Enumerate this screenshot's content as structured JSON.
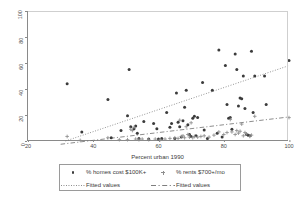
{
  "chart_data": {
    "type": "scatter",
    "title": "",
    "xlabel": "Percent urban 1990",
    "ylabel": "",
    "xlim": [
      20,
      100
    ],
    "ylim": [
      0,
      100
    ],
    "xticks": [
      20,
      40,
      60,
      80,
      100
    ],
    "yticks": [
      0,
      20,
      40,
      60,
      80,
      100
    ],
    "grid": false,
    "legend_position": "below-axis",
    "series": [
      {
        "name": "% homes cost $100K+",
        "marker": "filled-circle",
        "color": "#3b3b3b",
        "points": [
          [
            32.0,
            44.0
          ],
          [
            36.5,
            7.0
          ],
          [
            44.5,
            32.0
          ],
          [
            45.5,
            2.5
          ],
          [
            48.5,
            8.0
          ],
          [
            50.5,
            19.5
          ],
          [
            51.0,
            55.0
          ],
          [
            51.5,
            11.0
          ],
          [
            52.5,
            9.5
          ],
          [
            53.0,
            11.5
          ],
          [
            53.5,
            6.0
          ],
          [
            54.0,
            2.0
          ],
          [
            55.5,
            15.0
          ],
          [
            57.0,
            1.5
          ],
          [
            58.5,
            13.5
          ],
          [
            59.5,
            9.5
          ],
          [
            60.0,
            1.5
          ],
          [
            61.0,
            2.0
          ],
          [
            62.5,
            22.0
          ],
          [
            63.5,
            10.5
          ],
          [
            64.0,
            13.5
          ],
          [
            65.0,
            2.0
          ],
          [
            65.5,
            37.0
          ],
          [
            66.0,
            14.5
          ],
          [
            66.5,
            11.0
          ],
          [
            67.0,
            3.0
          ],
          [
            67.5,
            15.5
          ],
          [
            68.0,
            26.0
          ],
          [
            68.5,
            39.0
          ],
          [
            69.0,
            12.5
          ],
          [
            69.5,
            5.0
          ],
          [
            70.0,
            3.5
          ],
          [
            70.5,
            17.5
          ],
          [
            71.0,
            19.0
          ],
          [
            71.5,
            4.0
          ],
          [
            72.0,
            18.0
          ],
          [
            73.5,
            45.0
          ],
          [
            74.0,
            8.5
          ],
          [
            75.0,
            2.0
          ],
          [
            76.5,
            39.0
          ],
          [
            78.0,
            6.0
          ],
          [
            78.5,
            70.0
          ],
          [
            79.5,
            3.0
          ],
          [
            80.5,
            58.0
          ],
          [
            81.0,
            28.0
          ],
          [
            81.5,
            17.5
          ],
          [
            82.0,
            18.0
          ],
          [
            82.5,
            9.0
          ],
          [
            83.5,
            67.0
          ],
          [
            84.0,
            55.0
          ],
          [
            84.5,
            27.0
          ],
          [
            85.0,
            33.0
          ],
          [
            85.5,
            32.5
          ],
          [
            86.0,
            50.0
          ],
          [
            86.5,
            25.0
          ],
          [
            87.0,
            5.0
          ],
          [
            87.5,
            4.5
          ],
          [
            88.0,
            4.0
          ],
          [
            88.5,
            69.0
          ],
          [
            89.0,
            22.0
          ],
          [
            89.5,
            50.0
          ],
          [
            92.5,
            50.0
          ],
          [
            93.0,
            28.0
          ],
          [
            100.0,
            62.0
          ]
        ]
      },
      {
        "name": "% rents $700+/mo",
        "marker": "plus",
        "color": "#8e8e8e",
        "points": [
          [
            32.0,
            3.5
          ],
          [
            36.0,
            0.5
          ],
          [
            44.5,
            2.5
          ],
          [
            48.0,
            1.0
          ],
          [
            50.5,
            1.0
          ],
          [
            51.5,
            9.0
          ],
          [
            52.0,
            8.0
          ],
          [
            52.5,
            10.5
          ],
          [
            53.0,
            1.5
          ],
          [
            54.0,
            1.0
          ],
          [
            55.0,
            1.5
          ],
          [
            57.0,
            1.0
          ],
          [
            59.0,
            1.5
          ],
          [
            60.5,
            1.0
          ],
          [
            62.0,
            1.5
          ],
          [
            63.5,
            2.0
          ],
          [
            65.0,
            2.5
          ],
          [
            66.0,
            2.0
          ],
          [
            66.5,
            16.0
          ],
          [
            67.0,
            3.5
          ],
          [
            67.5,
            4.0
          ],
          [
            68.0,
            2.5
          ],
          [
            68.5,
            11.0
          ],
          [
            69.0,
            5.0
          ],
          [
            69.5,
            3.0
          ],
          [
            70.0,
            14.0
          ],
          [
            70.5,
            2.5
          ],
          [
            71.0,
            3.5
          ],
          [
            72.0,
            3.0
          ],
          [
            73.0,
            3.5
          ],
          [
            74.0,
            4.0
          ],
          [
            75.5,
            3.0
          ],
          [
            77.0,
            4.5
          ],
          [
            78.5,
            7.0
          ],
          [
            80.0,
            5.0
          ],
          [
            81.0,
            6.5
          ],
          [
            82.0,
            16.5
          ],
          [
            82.5,
            7.0
          ],
          [
            83.5,
            5.0
          ],
          [
            84.0,
            8.0
          ],
          [
            84.5,
            6.0
          ],
          [
            85.0,
            7.5
          ],
          [
            85.5,
            13.0
          ],
          [
            86.0,
            4.0
          ],
          [
            86.5,
            6.5
          ],
          [
            87.0,
            5.5
          ],
          [
            88.0,
            3.5
          ],
          [
            88.5,
            4.5
          ],
          [
            89.5,
            19.0
          ],
          [
            100.0,
            18.0
          ]
        ]
      }
    ],
    "fits": [
      {
        "name": "Fitted values",
        "style": "dotted",
        "for_series": "% homes cost $100K+",
        "x": [
          31.5,
          100.0
        ],
        "y": [
          0.0,
          58.0
        ]
      },
      {
        "name": "Fitted values",
        "style": "dashed",
        "for_series": "% rents $700+/mo",
        "x": [
          30.0,
          100.0
        ],
        "y": [
          -2.5,
          18.5
        ]
      }
    ]
  },
  "axes": {
    "x_title": "Percent urban 1990",
    "x_tick_labels": [
      "20",
      "40",
      "60",
      "80",
      "100"
    ],
    "y_tick_labels": [
      "0",
      "20",
      "40",
      "60",
      "80",
      "100"
    ]
  },
  "legend": {
    "entries": [
      {
        "label": "% homes cost $100K+",
        "key": "filled-circle-marker"
      },
      {
        "label": "% rents $700+/mo",
        "key": "plus-marker"
      },
      {
        "label": "Fitted values",
        "key": "dotted-line"
      },
      {
        "label": "Fitted values",
        "key": "dashed-line"
      }
    ]
  }
}
